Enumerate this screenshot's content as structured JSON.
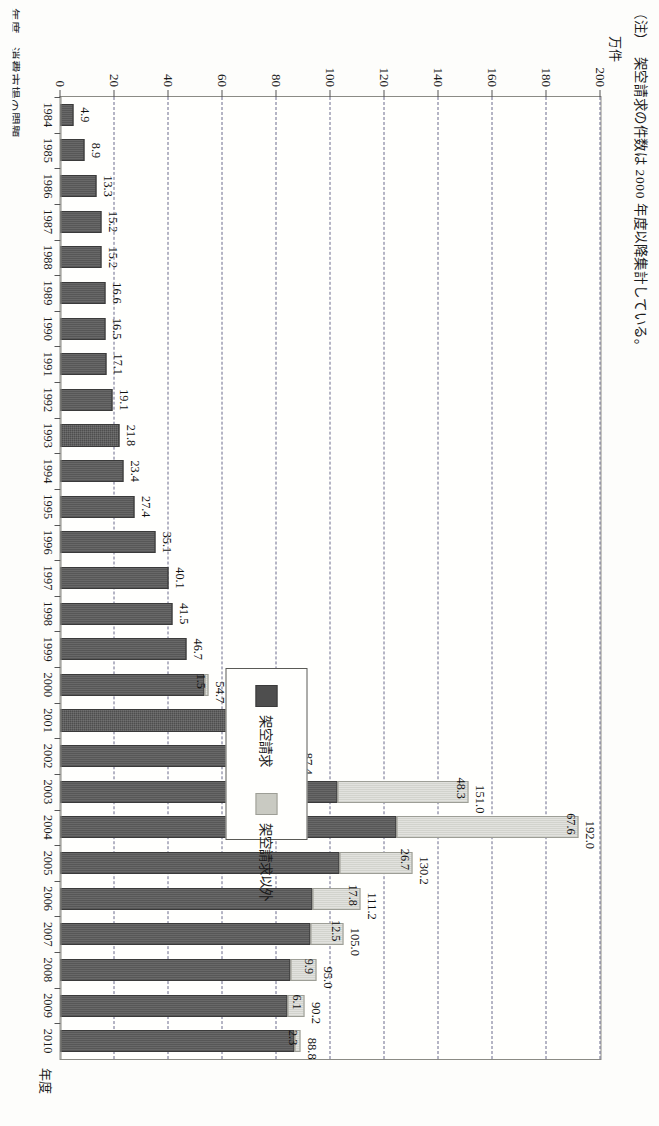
{
  "note": {
    "marker": "（注）",
    "text": "架空請求の件数は 2000 年度以降集計している。"
  },
  "caption": "年度　消費市場の問題",
  "axes": {
    "value_unit": "万件",
    "value_ticks": [
      "0",
      "20",
      "40",
      "60",
      "80",
      "100",
      "120",
      "140",
      "160",
      "180",
      "200"
    ],
    "category_axis_name": "年度"
  },
  "legend": {
    "position": "inside-right",
    "items": [
      {
        "label": "架空請求",
        "color": "#4e4e4e",
        "key": "fictitious"
      },
      {
        "label": "架空請求以外",
        "color": "#c9cac2",
        "key": "other"
      }
    ]
  },
  "colors": {
    "dark": "#4e4e4e",
    "light": "#c9cac2",
    "grid": "#6b6b8c",
    "frame": "#8b8b85"
  },
  "chart_data": {
    "type": "bar",
    "title": "",
    "xlabel": "年度",
    "ylabel": "万件",
    "ylim": [
      0,
      200
    ],
    "grid": true,
    "stacked": true,
    "orientation": "vertical-rotated-90cw",
    "categories": [
      "1984",
      "1985",
      "1986",
      "1987",
      "1988",
      "1989",
      "1990",
      "1991",
      "1992",
      "1993",
      "1994",
      "1995",
      "1996",
      "1997",
      "1998",
      "1999",
      "2000",
      "2001",
      "2002",
      "2003",
      "2004",
      "2005",
      "2006",
      "2007",
      "2008",
      "2009",
      "2010"
    ],
    "series": [
      {
        "name": "架空請求",
        "color": "#4e4e4e",
        "values": [
          4.9,
          8.9,
          13.3,
          15.2,
          15.2,
          16.6,
          16.5,
          17.1,
          19.1,
          21.8,
          23.4,
          27.4,
          35.1,
          40.1,
          41.5,
          46.7,
          53.2,
          63.9,
          79.8,
          102.7,
          124.4,
          103.5,
          93.4,
          92.5,
          85.1,
          84.1,
          86.5
        ]
      },
      {
        "name": "架空請求以外",
        "color": "#c9cac2",
        "values": [
          null,
          null,
          null,
          null,
          null,
          null,
          null,
          null,
          null,
          null,
          null,
          null,
          null,
          null,
          null,
          null,
          1.5,
          1.7,
          7.6,
          48.3,
          67.6,
          26.7,
          17.8,
          12.5,
          9.9,
          6.1,
          2.3
        ]
      }
    ],
    "dark_segment_labels": [
      {
        "category": "1984",
        "value": 4.9,
        "text": "4.9"
      },
      {
        "category": "1985",
        "value": 8.9,
        "text": "8.9"
      },
      {
        "category": "1986",
        "value": 13.3,
        "text": "13.3"
      },
      {
        "category": "1987",
        "value": 15.2,
        "text": "15.2"
      },
      {
        "category": "1988",
        "value": 15.2,
        "text": "15.2"
      },
      {
        "category": "1989",
        "value": 16.6,
        "text": "16.6"
      },
      {
        "category": "1990",
        "value": 16.5,
        "text": "16.5"
      },
      {
        "category": "1991",
        "value": 17.1,
        "text": "17.1"
      },
      {
        "category": "1992",
        "value": 19.1,
        "text": "19.1"
      },
      {
        "category": "1993",
        "value": 21.8,
        "text": "21.8"
      },
      {
        "category": "1994",
        "value": 23.4,
        "text": "23.4"
      },
      {
        "category": "1995",
        "value": 27.4,
        "text": "27.4"
      },
      {
        "category": "1996",
        "value": 35.1,
        "text": "35.1"
      },
      {
        "category": "1997",
        "value": 40.1,
        "text": "40.1"
      },
      {
        "category": "1998",
        "value": 41.5,
        "text": "41.5"
      },
      {
        "category": "1999",
        "value": 46.7,
        "text": "46.7"
      }
    ],
    "light_segment_labels": [
      {
        "category": "2000",
        "value": 1.5,
        "text": "1.5"
      },
      {
        "category": "2001",
        "value": 1.7,
        "text": "1.7"
      },
      {
        "category": "2002",
        "value": 7.6,
        "text": "7.6"
      },
      {
        "category": "2003",
        "value": 48.3,
        "text": "48.3"
      },
      {
        "category": "2004",
        "value": 67.6,
        "text": "67.6"
      },
      {
        "category": "2005",
        "value": 26.7,
        "text": "26.7"
      },
      {
        "category": "2006",
        "value": 17.8,
        "text": "17.8"
      },
      {
        "category": "2007",
        "value": 12.5,
        "text": "12.5"
      },
      {
        "category": "2008",
        "value": 9.9,
        "text": "9.9"
      },
      {
        "category": "2009",
        "value": 6.1,
        "text": "6.1"
      },
      {
        "category": "2010",
        "value": 2.3,
        "text": "2.3"
      }
    ],
    "total_labels": [
      {
        "category": "2000",
        "value": 54.7,
        "text": "54.7"
      },
      {
        "category": "2001",
        "value": 65.6,
        "text": "65.6"
      },
      {
        "category": "2002",
        "value": 87.4,
        "text": "87.4"
      },
      {
        "category": "2003",
        "value": 151.0,
        "text": "151.0"
      },
      {
        "category": "2004",
        "value": 192.0,
        "text": "192.0"
      },
      {
        "category": "2005",
        "value": 130.2,
        "text": "130.2"
      },
      {
        "category": "2006",
        "value": 111.2,
        "text": "111.2"
      },
      {
        "category": "2007",
        "value": 105.0,
        "text": "105.0"
      },
      {
        "category": "2008",
        "value": 95.0,
        "text": "95.0"
      },
      {
        "category": "2009",
        "value": 90.2,
        "text": "90.2"
      },
      {
        "category": "2010",
        "value": 88.8,
        "text": "88.8"
      }
    ]
  }
}
